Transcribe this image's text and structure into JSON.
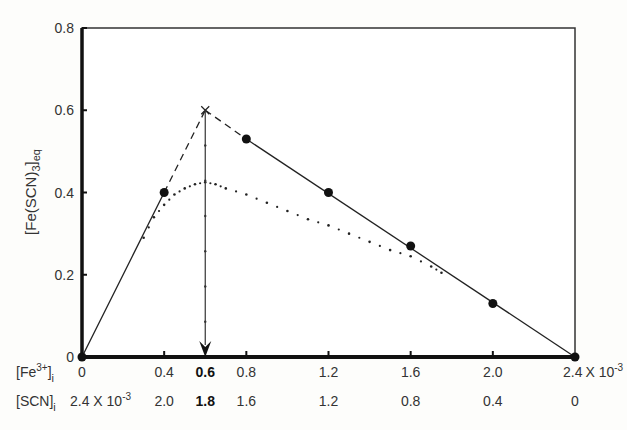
{
  "chart_data": {
    "type": "line",
    "title": "",
    "ylabel": "[Fe(SCN)3]eq",
    "ylabel_parts": {
      "base": "[Fe(SCN)",
      "sub1": "3",
      "close": "]",
      "sub2": "eq"
    },
    "ylim": [
      0,
      0.8
    ],
    "yticks": [
      "0",
      "0.2",
      "0.4",
      "0.6",
      "0.8"
    ],
    "xlim": [
      0,
      2.4
    ],
    "x_rows": [
      {
        "label": "[Fe3+]i",
        "label_parts": {
          "base": "[Fe",
          "sup": "3+",
          "close": "]",
          "sub": "i"
        },
        "ticks": [
          "0",
          "0.4",
          "0.6",
          "0.8",
          "1.2",
          "1.6",
          "2.0",
          "2.4"
        ],
        "exponent_note": "X 10-3",
        "bold_tick": "0.6"
      },
      {
        "label": "[SCN]i",
        "label_parts": {
          "base": "[SCN]",
          "sub": "i"
        },
        "ticks": [
          "2.4 X 10-3",
          "2.0",
          "1.8",
          "1.6",
          "1.2",
          "0.8",
          "0.4",
          "0"
        ],
        "bold_tick": "1.8"
      }
    ],
    "series": [
      {
        "name": "Measured data (points)",
        "style": "markers",
        "x": [
          0,
          0.4,
          0.8,
          1.2,
          1.6,
          2.0,
          2.4
        ],
        "y": [
          0.0,
          0.4,
          0.53,
          0.4,
          0.27,
          0.13,
          0.0
        ]
      },
      {
        "name": "Linear fit (solid)",
        "style": "solid",
        "segments": [
          {
            "x": [
              0,
              0.4
            ],
            "y": [
              0,
              0.4
            ]
          },
          {
            "x": [
              0.8,
              2.4
            ],
            "y": [
              0.53,
              0
            ]
          }
        ]
      },
      {
        "name": "Extrapolation (dashed)",
        "style": "dashed",
        "segments": [
          {
            "x": [
              0.4,
              0.6
            ],
            "y": [
              0.4,
              0.6
            ]
          },
          {
            "x": [
              0.6,
              0.8
            ],
            "y": [
              0.6,
              0.53
            ]
          }
        ]
      },
      {
        "name": "Actual curve (dotted)",
        "style": "dotted",
        "x": [
          0.3,
          0.35,
          0.4,
          0.45,
          0.5,
          0.55,
          0.6,
          0.65,
          0.7,
          0.8,
          0.9,
          1.0,
          1.1,
          1.2,
          1.3,
          1.4,
          1.5,
          1.6,
          1.7,
          1.75
        ],
        "y": [
          0.29,
          0.34,
          0.37,
          0.395,
          0.41,
          0.42,
          0.425,
          0.42,
          0.41,
          0.395,
          0.375,
          0.355,
          0.335,
          0.32,
          0.3,
          0.28,
          0.26,
          0.245,
          0.22,
          0.205
        ]
      }
    ],
    "annotations": [
      {
        "type": "intersection",
        "marker": "x",
        "x": 0.6,
        "y": 0.6
      },
      {
        "type": "arrow-down",
        "from": {
          "x": 0.6,
          "y": 0.6
        },
        "to": {
          "x": 0.6,
          "y": 0
        }
      }
    ],
    "grid": false,
    "legend": null
  }
}
